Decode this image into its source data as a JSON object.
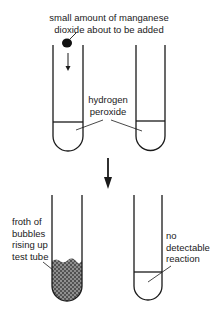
{
  "diagram": {
    "title_label": {
      "line1": "small amount of manganese",
      "line2": "dioxide about to be added"
    },
    "liquid_label": {
      "line1": "hydrogen",
      "line2": "peroxide"
    },
    "froth_label": {
      "line1": "froth of",
      "line2": "bubbles",
      "line3": "rising up",
      "line4": "test tube"
    },
    "no_reaction_label": {
      "line1": "no",
      "line2": "detectable",
      "line3": "reaction"
    },
    "colors": {
      "ink": "#1a1a1a",
      "background": "#ffffff"
    },
    "stages": [
      {
        "name": "before",
        "tubes": [
          "hydrogen peroxide + manganese dioxide about to be added",
          "hydrogen peroxide"
        ]
      },
      {
        "name": "after",
        "tubes": [
          "froth of bubbles",
          "no detectable reaction"
        ]
      }
    ]
  }
}
